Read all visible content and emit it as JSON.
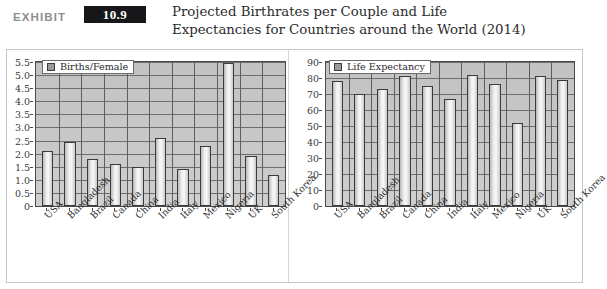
{
  "header": {
    "exhibit_word": "EXHIBIT",
    "exhibit_number": "10.9",
    "title_line1": "Projected Birthrates per Couple and Life",
    "title_line2": "Expectancies for Countries around the World (2014)"
  },
  "colors": {
    "badge_background": "#17171a",
    "badge_text": "#ffffff",
    "exhibit_word": "#8d8d8d",
    "title_text": "#2c2c2c",
    "plot_background": "#c8c8c8",
    "bar_fill": "#efefef",
    "bar_outline": "#3b3b3b",
    "gridline": "#6e6e6e",
    "panel_border": "#c8c8c8"
  },
  "chart_data": [
    {
      "id": "births-per-female",
      "type": "bar",
      "title": "",
      "xlabel": "",
      "ylabel": "",
      "legend": [
        "Births/Female"
      ],
      "legend_position": "top-left",
      "grid": true,
      "ylim": [
        0,
        5.5
      ],
      "ytick_labels": [
        "0",
        "0.5",
        "1.0",
        "1.5",
        "2.0",
        "2.5",
        "3.0",
        "3.5",
        "4.0",
        "4.5",
        "5.0",
        "5.5"
      ],
      "ytick_values": [
        0,
        0.5,
        1.0,
        1.5,
        2.0,
        2.5,
        3.0,
        3.5,
        4.0,
        4.5,
        5.0,
        5.5
      ],
      "categories": [
        "USA",
        "Bangladesh",
        "Brazil",
        "Canada",
        "China",
        "India",
        "Italy",
        "Mexico",
        "Nigeria",
        "UK",
        "South Korea"
      ],
      "values": [
        2.1,
        2.45,
        1.8,
        1.6,
        1.5,
        2.6,
        1.4,
        2.3,
        5.45,
        1.9,
        1.2
      ]
    },
    {
      "id": "life-expectancy",
      "type": "bar",
      "title": "",
      "xlabel": "",
      "ylabel": "",
      "legend": [
        "Life Expectancy"
      ],
      "legend_position": "top-left",
      "grid": true,
      "ylim": [
        0,
        90
      ],
      "ytick_labels": [
        "0",
        "10",
        "20",
        "30",
        "40",
        "50",
        "60",
        "70",
        "80",
        "90"
      ],
      "ytick_values": [
        0,
        10,
        20,
        30,
        40,
        50,
        60,
        70,
        80,
        90
      ],
      "categories": [
        "USA",
        "Bangladesh",
        "Brazil",
        "Canada",
        "China",
        "India",
        "Italy",
        "Mexico",
        "Nigeria",
        "UK",
        "South Korea"
      ],
      "values": [
        78,
        70,
        73,
        81,
        75,
        67,
        82,
        76,
        52,
        81,
        79
      ]
    }
  ]
}
